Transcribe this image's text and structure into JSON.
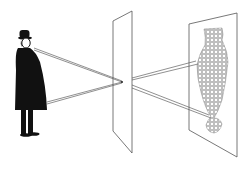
{
  "diagram": {
    "colors": {
      "background": "#ffffff",
      "ink": "#111111",
      "plane_line": "#555555",
      "ray": "#444444",
      "image_dots": "#777777"
    },
    "figure": {
      "label": ""
    },
    "pinhole_plane": {
      "label": ""
    },
    "projection_plane": {
      "label": ""
    }
  }
}
